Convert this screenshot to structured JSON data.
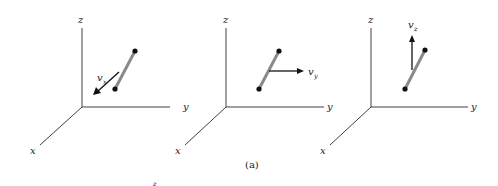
{
  "figure": {
    "caption": "(a)",
    "panels": [
      {
        "axes": {
          "z": "z",
          "y": "y",
          "x": "x"
        },
        "velocity": {
          "symbol": "v",
          "subscript": "x",
          "direction": "along -x (toward viewer)"
        }
      },
      {
        "axes": {
          "z": "z",
          "y": "y",
          "x": "x"
        },
        "velocity": {
          "symbol": "v",
          "subscript": "y",
          "direction": "along +y"
        }
      },
      {
        "axes": {
          "z": "z",
          "y": "y",
          "x": "x"
        },
        "velocity": {
          "symbol": "v",
          "subscript": "z",
          "direction": "along +z"
        }
      }
    ],
    "stray_label": "z"
  },
  "colors": {
    "axis": "#2a2a2a",
    "rod": "#8a8a8a",
    "dot": "#111111",
    "vector": "#111111"
  }
}
